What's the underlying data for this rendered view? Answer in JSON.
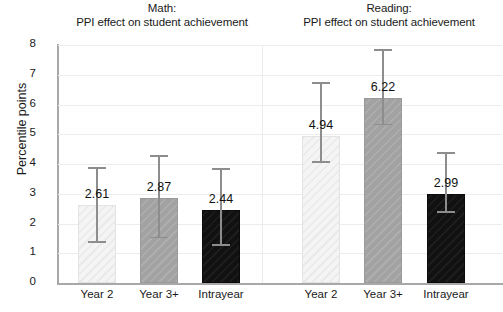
{
  "chart_data": {
    "type": "bar",
    "title": "",
    "panels": [
      {
        "name": "math",
        "title_line1": "Math:",
        "title_line2": "PPI effect on student achievement",
        "categories": [
          "Year 2",
          "Year 3+",
          "Intrayear"
        ],
        "values": [
          2.61,
          2.87,
          2.44
        ],
        "value_labels": [
          "2.61",
          "2.87",
          "2.44"
        ],
        "ci_low": [
          1.35,
          1.5,
          1.25
        ],
        "ci_high": [
          3.9,
          4.3,
          3.85
        ],
        "bar_styles": [
          "light",
          "gray",
          "dark"
        ]
      },
      {
        "name": "reading",
        "title_line1": "Reading:",
        "title_line2": "PPI effect on student achievement",
        "categories": [
          "Year 2",
          "Year 3+",
          "Intrayear"
        ],
        "values": [
          4.94,
          6.22,
          2.99
        ],
        "value_labels": [
          "4.94",
          "6.22",
          "2.99"
        ],
        "ci_low": [
          4.05,
          5.3,
          2.35
        ],
        "ci_high": [
          6.75,
          7.85,
          4.4
        ],
        "bar_styles": [
          "light",
          "gray",
          "dark"
        ]
      }
    ],
    "ylabel": "Percentile points",
    "xlabel": "",
    "ylim": [
      0,
      8
    ],
    "yticks": [
      0,
      1,
      2,
      3,
      4,
      5,
      6,
      7,
      8
    ],
    "ytick_labels": [
      "0",
      "1",
      "2",
      "3",
      "4",
      "5",
      "6",
      "7",
      "8"
    ],
    "grid": true,
    "legend": "none",
    "colors": {
      "light_bar": "#f4f4f4",
      "gray_bar": "#a2a2a2",
      "dark_bar": "#111111",
      "axis": "#a8a8a8",
      "gridline": "#ececec",
      "error_bar": "#8d8d8d",
      "text": "#1a1a1a"
    }
  }
}
